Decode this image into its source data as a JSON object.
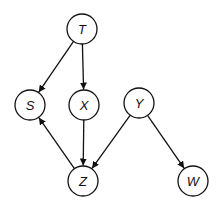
{
  "diagram": {
    "type": "directed-graph",
    "nodes": [
      {
        "id": "T",
        "label": "T",
        "x": 82,
        "y": 29
      },
      {
        "id": "S",
        "label": "S",
        "x": 30,
        "y": 105
      },
      {
        "id": "X",
        "label": "X",
        "x": 84,
        "y": 105
      },
      {
        "id": "Y",
        "label": "Y",
        "x": 139,
        "y": 103
      },
      {
        "id": "Z",
        "label": "Z",
        "x": 83,
        "y": 181
      },
      {
        "id": "W",
        "label": "W",
        "x": 193,
        "y": 181
      }
    ],
    "edges": [
      {
        "from": "T",
        "to": "S"
      },
      {
        "from": "T",
        "to": "X"
      },
      {
        "from": "X",
        "to": "Z"
      },
      {
        "from": "Y",
        "to": "Z"
      },
      {
        "from": "Y",
        "to": "W"
      },
      {
        "from": "Z",
        "to": "S"
      }
    ],
    "node_radius": 15,
    "stroke_color": "#111111",
    "fill_color": "#ffffff"
  }
}
